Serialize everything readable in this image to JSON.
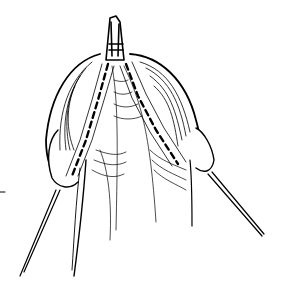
{
  "image": {
    "kind": "line-drawing",
    "subject": "surgical illustration with clamp and sutured tissue flaps",
    "background": "#ffffff",
    "ink": "#000000",
    "width": 284,
    "height": 298
  }
}
